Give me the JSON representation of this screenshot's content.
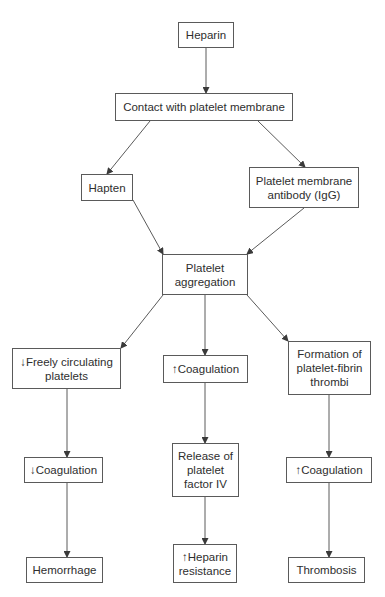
{
  "diagram": {
    "type": "flowchart",
    "colors": {
      "background": "#ffffff",
      "line": "#5a5a5a",
      "text": "#2e2e2e"
    },
    "nodes": {
      "heparin": {
        "label": "Heparin"
      },
      "contact": {
        "label": "Contact with platelet membrane"
      },
      "hapten": {
        "label": "Hapten"
      },
      "antibody": {
        "label": "Platelet membrane\nantibody (IgG)"
      },
      "aggregation": {
        "label": "Platelet\naggregation"
      },
      "freely": {
        "label": "↓Freely circulating\nplatelets"
      },
      "coag_mid": {
        "label": "↑Coagulation"
      },
      "formation": {
        "label": "Formation of\nplatelet-fibrin\nthrombi"
      },
      "coag_left": {
        "label": "↓Coagulation"
      },
      "release": {
        "label": "Release of\nplatelet\nfactor IV"
      },
      "coag_right": {
        "label": "↑Coagulation"
      },
      "hemorrhage": {
        "label": "Hemorrhage"
      },
      "resistance": {
        "label": "↑Heparin\nresistance"
      },
      "thrombosis": {
        "label": "Thrombosis"
      }
    },
    "edges": [
      {
        "from": "heparin",
        "to": "contact"
      },
      {
        "from": "contact",
        "to": "hapten"
      },
      {
        "from": "contact",
        "to": "antibody"
      },
      {
        "from": "hapten",
        "to": "aggregation"
      },
      {
        "from": "antibody",
        "to": "aggregation"
      },
      {
        "from": "aggregation",
        "to": "freely"
      },
      {
        "from": "aggregation",
        "to": "coag_mid"
      },
      {
        "from": "aggregation",
        "to": "formation"
      },
      {
        "from": "freely",
        "to": "coag_left"
      },
      {
        "from": "coag_mid",
        "to": "release"
      },
      {
        "from": "formation",
        "to": "coag_right"
      },
      {
        "from": "coag_left",
        "to": "hemorrhage"
      },
      {
        "from": "release",
        "to": "resistance"
      },
      {
        "from": "coag_right",
        "to": "thrombosis"
      }
    ]
  }
}
